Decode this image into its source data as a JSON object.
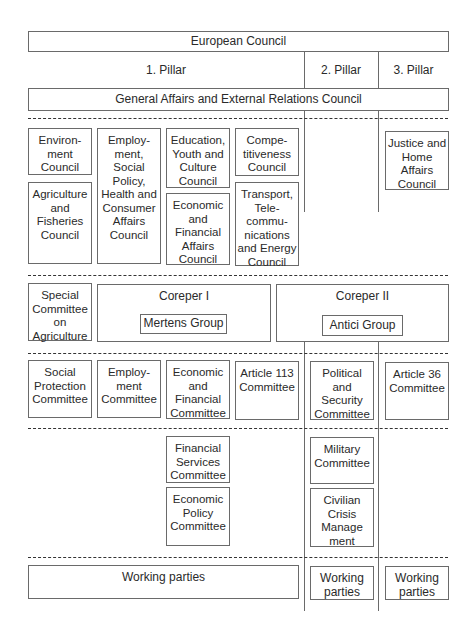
{
  "top": {
    "european_council": "European Council",
    "pillars": [
      "1. Pillar",
      "2. Pillar",
      "3. Pillar"
    ],
    "gaerc": "General Affairs and External Relations Council"
  },
  "councils": {
    "pillar1": [
      "Environ-\nment\nCouncil",
      "Employ-\nment,\nSocial\nPolicy,\nHealth and\nConsumer\nAffairs\nCouncil",
      "Education,\nYouth and\nCulture\nCouncil",
      "Compe-\ntitiveness\nCouncil",
      "Agriculture\nand\nFisheries\nCouncil",
      "Economic\nand\nFinancial\nAffairs\nCouncil",
      "Transport,\nTele-\ncommu-\nnications\nand Energy\nCouncil"
    ],
    "pillar3": [
      "Justice and\nHome\nAffairs\nCouncil"
    ]
  },
  "coreper": {
    "special_committee": "Special\nCommittee\non\nAgriculture",
    "coreper1": "Coreper I",
    "mertens": "Mertens Group",
    "coreper2": "Coreper II",
    "antici": "Antici Group"
  },
  "committees": {
    "row1": [
      "Social\nProtection\nCommittee",
      "Employ-\nment\nCommittee",
      "Economic\nand\nFinancial\nCommittee",
      "Article 113\nCommittee",
      "Political\nand\nSecurity\nCommittee",
      "Article 36\nCommittee"
    ],
    "row2": [
      "Financial\nServices\nCommittee",
      "Economic\nPolicy\nCommittee",
      "Military\nCommittee",
      "Civilian\nCrisis\nManage\nment"
    ]
  },
  "working_parties": [
    "Working parties",
    "Working\nparties",
    "Working\nparties"
  ]
}
